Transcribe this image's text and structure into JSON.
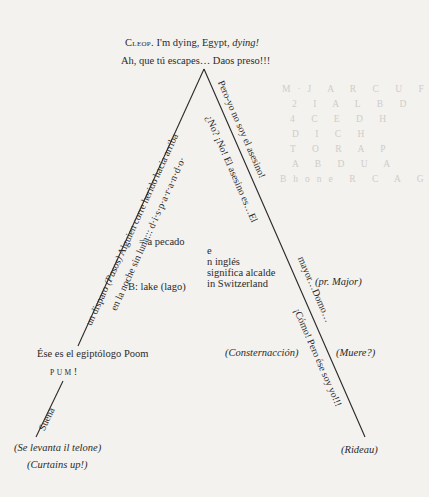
{
  "header": {
    "line1_speaker": "Cleop.",
    "line1_text": " I'm dying, Egypt, ",
    "line1_italic": "dying!",
    "line2": "Ah, que tú escapes… Daos preso!!!"
  },
  "left_side": {
    "upper_outer": "un disparo (Pasos) Alguien corre herido hacia arriba",
    "upper_outer_parts": [
      "un disparo ",
      "(Pasos)",
      " Alguien corre herido hacia arriba"
    ],
    "upper_inner": "en la noche sin luna::: d·i·s·p·a·r·a·n·d·o·",
    "middle_label": "Ése es el egiptólogo Poom",
    "pum": "PUM",
    "pum_bang": "!",
    "lower_outer": "Suena",
    "bottom_line1": "(Se levanta il telone)",
    "bottom_line2": "(Curtains up!)"
  },
  "inside": {
    "equals_note": "= a pecado",
    "lake_note": "B: lake (lago)",
    "english_note": [
      "e",
      "n  inglés",
      "significa alcalde",
      "in Switzerland"
    ]
  },
  "right_side": {
    "outer_1": "Pero-yo no soy el asesino!",
    "inner_1": "¿No? ¡No! El asesino es…El",
    "outer_2": "mayor…Domo…",
    "inner_2": "¡Cómo! Pero ése soy yo!!!",
    "major_note": "(pr. Major)",
    "consternation": "(Consternacción)",
    "muere": "(Muere?)",
    "bottom": "(Rideau)"
  },
  "bleed_through": {
    "rows": [
      "M·J A R C U F",
      "2 I A L B D",
      "4 C E D H",
      "D I C H",
      "T O R A P",
      "A B D U A",
      "Bhone R C A G"
    ]
  },
  "colors": {
    "paper": "#f3f2ef",
    "ink": "#2a2a2a",
    "bleed": "#cfcdc8"
  }
}
